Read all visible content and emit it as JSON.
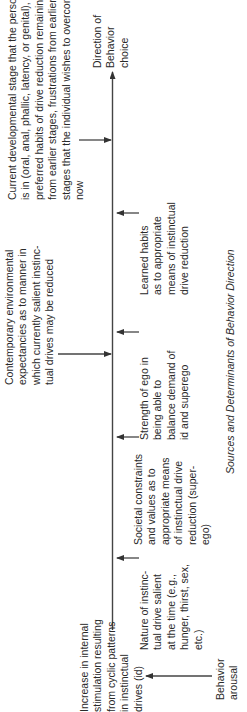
{
  "diagram": {
    "caption": "Sources and Determinants of Behavior Direction",
    "main_axis": {
      "start_label": "Increase in internal stimulation resulting from cyclic patterns in instinctual drives (id)",
      "end_label": "Direction of Behavior choice"
    },
    "nodes": {
      "current_developmental": {
        "lines": [
          "Current developmental stage that the person",
          "is in (oral, anal, phallic, latency, or genital),",
          "preferred habits of drive reduction remaining",
          "from earlier stages, frustrations from earlier",
          "stages that the individual wishes to overcome",
          "now"
        ]
      },
      "direction": {
        "lines": [
          "Direction of",
          "Behavior",
          "choice"
        ]
      },
      "contemporary": {
        "lines": [
          "Contemporary environmental",
          "expectancies as to manner in",
          "which currently salient instinc-",
          "tual drives may be reduced"
        ]
      },
      "learned_habits": {
        "lines": [
          "Learned habits",
          "as to appropriate",
          "means of instinctual",
          "drive reduction"
        ]
      },
      "strength_of_ego": {
        "lines": [
          "Strength of ego in",
          "being able to",
          "balance demand of",
          "id and superego"
        ]
      },
      "societal_constraints": {
        "lines": [
          "Societal constraints",
          "and values as to",
          "appropriate means",
          "of instinctual drive",
          "reduction (super-",
          "ego)"
        ]
      },
      "nature_of_drive": {
        "lines": [
          "Nature of instinc-",
          "tual drive salient",
          "at the time (e.g.,",
          "hunger, thirst, sex,",
          "etc.)"
        ]
      },
      "increase_stimulation": {
        "lines": [
          "Increase in internal",
          "stimulation resulting",
          "from cyclic patterns",
          "in instinctual",
          "drives (id)"
        ]
      },
      "behavior_arousal": {
        "lines": [
          "Behavior",
          "arousal"
        ]
      }
    },
    "colors": {
      "line": "#444444",
      "text": "#2a2a2a",
      "background": "#ffffff"
    }
  }
}
